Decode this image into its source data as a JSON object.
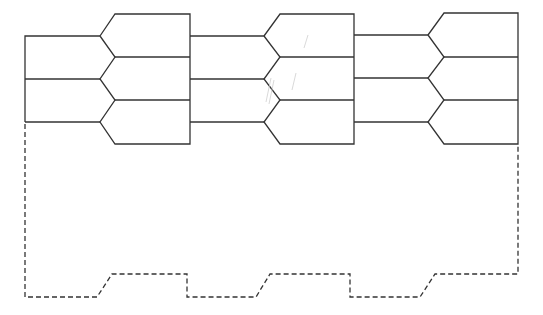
{
  "diagram": {
    "stroke_color": "#333333",
    "background": "#ffffff",
    "units": [
      {
        "left_x": 25,
        "point_x": 100,
        "tab_x": 115,
        "right_x": 190
      },
      {
        "left_x": 190,
        "point_x": 264,
        "tab_x": 280,
        "right_x": 354
      },
      {
        "left_x": 354,
        "point_x": 428,
        "tab_x": 444,
        "right_x": 518
      }
    ],
    "row_lines_y": [
      36,
      79,
      122
    ],
    "tab_lines_y": [
      14,
      57,
      100,
      144
    ],
    "dashed_outline": {
      "left_x": 25,
      "right_x": 518,
      "top_y": 122,
      "right_top_y": 144,
      "low_y": 297,
      "high_y": 274
    }
  }
}
